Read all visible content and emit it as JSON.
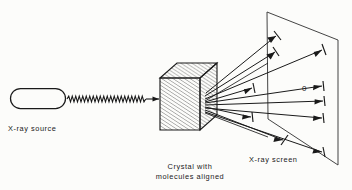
{
  "figure": {
    "background_color": "#fcfcfa",
    "ink_color": "#1a1a1a",
    "labels": {
      "source": "X-ray source",
      "crystal_line1": "Crystal with",
      "crystal_line2": "molecules aligned",
      "screen": "X-ray screen",
      "center_spot": "0"
    },
    "elements": {
      "source_tube": {
        "name": "x-ray-source-tube",
        "shape": "rounded-capsule",
        "x": 10,
        "y": 88,
        "width": 56,
        "height": 21,
        "radius": 10.5
      },
      "incident_beam": {
        "name": "incident-x-ray-beam",
        "shape": "wavy-line-with-arrow",
        "from_x": 67,
        "to_x": 158,
        "y": 99,
        "amplitude": 3.0,
        "wavelength": 7.0
      },
      "crystal": {
        "name": "crystal-cube",
        "shape": "hatched-isometric-cube",
        "front_left": 160,
        "front_top": 78,
        "front_width": 40,
        "front_height": 52,
        "depth_x": 17,
        "depth_y": -15,
        "hatch_spacing": 2.6,
        "hatch_angle_deg": -58
      },
      "screen": {
        "name": "x-ray-screen-plane",
        "shape": "parallelogram",
        "points": "267,12 338,40 338,165 268,119"
      },
      "diffracted_rays": {
        "name": "diffracted-ray-group",
        "origin_x": 204,
        "origin_y": 104,
        "count": 9,
        "tips": [
          {
            "x": 285,
            "y": 36,
            "tick": "perp"
          },
          {
            "x": 283,
            "y": 52,
            "tick": "perp"
          },
          {
            "x": 331,
            "y": 50,
            "tick": "perp"
          },
          {
            "x": 260,
            "y": 88,
            "tick": "perp"
          },
          {
            "x": 330,
            "y": 86,
            "tick": "perp"
          },
          {
            "x": 332,
            "y": 101,
            "tick": "perp"
          },
          {
            "x": 259,
            "y": 118,
            "tick": "perp"
          },
          {
            "x": 330,
            "y": 118,
            "tick": "perp"
          },
          {
            "x": 291,
            "y": 141,
            "tick": "perp"
          },
          {
            "x": 331,
            "y": 152,
            "tick": "perp"
          }
        ]
      }
    }
  }
}
